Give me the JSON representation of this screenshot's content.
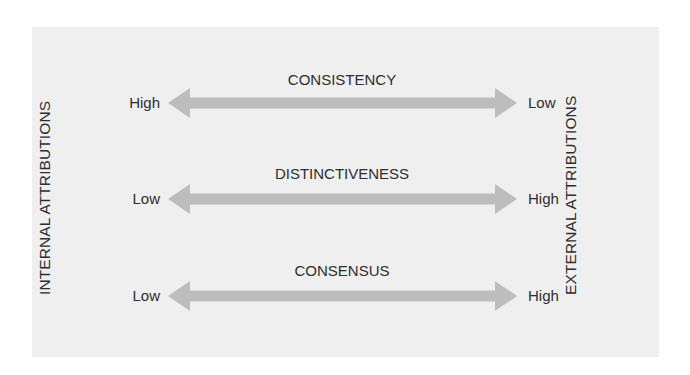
{
  "diagram": {
    "left_axis_label": "INTERNAL ATTRIBUTIONS",
    "right_axis_label": "EXTERNAL ATTRIBUTIONS",
    "rows": [
      {
        "title": "CONSISTENCY",
        "left_end": "High",
        "right_end": "Low"
      },
      {
        "title": "DISTINCTIVENESS",
        "left_end": "Low",
        "right_end": "High"
      },
      {
        "title": "CONSENSUS",
        "left_end": "Low",
        "right_end": "High"
      }
    ],
    "colors": {
      "panel_background": "#efefef",
      "arrow_fill": "#bdbdbd",
      "text": "#2e2e2e"
    }
  }
}
